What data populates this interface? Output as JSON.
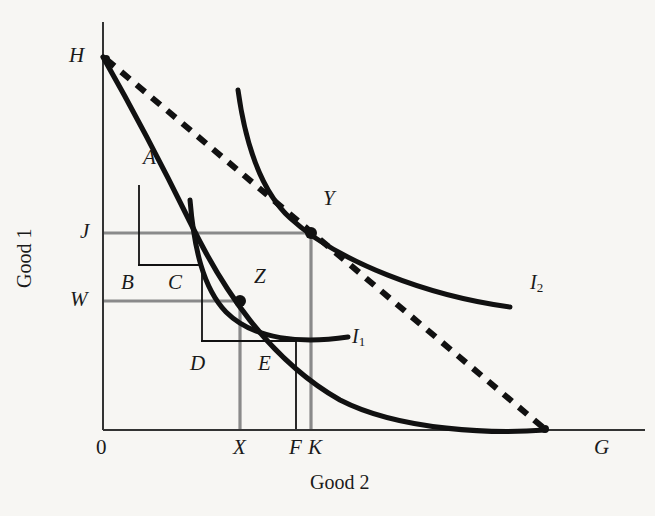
{
  "figure": {
    "type": "economics-diagram",
    "background_color": "#f7f6f3",
    "ink_color": "#111111",
    "guide_color": "#8a8a8a"
  },
  "axes": {
    "y_label": "Good 1",
    "x_label": "Good 2",
    "origin_label": "0",
    "x_axis": {
      "x_start": 103,
      "x_end": 645,
      "y": 430
    },
    "y_axis": {
      "x": 103,
      "y_start": 22,
      "y_end": 430
    }
  },
  "y_ticks": [
    {
      "label": "H",
      "value_px": 57,
      "type": "intercept"
    },
    {
      "label": "J",
      "value_px": 233,
      "type": "guide"
    },
    {
      "label": "W",
      "value_px": 301,
      "type": "guide"
    }
  ],
  "x_ticks": [
    {
      "label": "X",
      "value_px": 240,
      "type": "guide"
    },
    {
      "label": "F",
      "value_px": 296,
      "type": "thin"
    },
    {
      "label": "K",
      "value_px": 311,
      "type": "guide"
    },
    {
      "label": "G",
      "value_px": 600,
      "type": "intercept"
    }
  ],
  "points": [
    {
      "label": "Y",
      "x_px": 311,
      "y_px": 233,
      "marker": true,
      "label_dx": 16,
      "label_dy": -36
    },
    {
      "label": "Z",
      "x_px": 240,
      "y_px": 301,
      "marker": true,
      "label_dx": 18,
      "label_dy": -34
    },
    {
      "label": "A",
      "x_px": 148,
      "y_px": 158,
      "marker": false,
      "label_dx": 0,
      "label_dy": 0
    },
    {
      "label": "B",
      "x_px": 127,
      "y_px": 283,
      "marker": false,
      "label_dx": 0,
      "label_dy": 0
    },
    {
      "label": "C",
      "x_px": 173,
      "y_px": 283,
      "marker": false,
      "label_dx": 0,
      "label_dy": 0
    },
    {
      "label": "D",
      "x_px": 195,
      "y_px": 365,
      "marker": false,
      "label_dx": 0,
      "label_dy": 0
    },
    {
      "label": "E",
      "x_px": 263,
      "y_px": 365,
      "marker": false,
      "label_dx": 0,
      "label_dy": 0
    }
  ],
  "curves": [
    {
      "name": "ppf",
      "label": "",
      "style": "solid-thick",
      "path": "M 103,57 C 140,120 175,190 205,250 C 240,320 300,390 380,418 C 440,432 500,433 545,430"
    },
    {
      "name": "indifference-curve-1",
      "label": "I",
      "label_sub": "1",
      "style": "solid-thick",
      "label_x": 352,
      "label_y": 326,
      "path": "M 190,200 C 196,250 205,290 228,315 C 255,340 300,344 348,338"
    },
    {
      "name": "indifference-curve-2",
      "label": "I",
      "label_sub": "2",
      "style": "solid-thick",
      "label_x": 530,
      "label_y": 272,
      "path": "M 238,90 C 248,150 265,195 295,222 C 340,262 430,295 510,307"
    },
    {
      "name": "budget-line",
      "label": "",
      "style": "dashed-thick",
      "path": "M 105,58 L 545,429"
    }
  ],
  "guide_lines": [
    {
      "name": "j-horizontal",
      "color": "gray",
      "x1": 103,
      "y1": 233,
      "x2": 311,
      "y2": 233
    },
    {
      "name": "w-horizontal",
      "color": "gray",
      "x1": 103,
      "y1": 301,
      "x2": 240,
      "y2": 301
    },
    {
      "name": "x-vertical",
      "color": "gray",
      "x1": 240,
      "y1": 301,
      "x2": 240,
      "y2": 430
    },
    {
      "name": "k-vertical",
      "color": "gray",
      "x1": 311,
      "y1": 233,
      "x2": 311,
      "y2": 430
    },
    {
      "name": "a-vertical",
      "color": "black-thin",
      "x1": 139,
      "y1": 185,
      "x2": 139,
      "y2": 265
    },
    {
      "name": "bc-horizontal",
      "color": "black-thin",
      "x1": 139,
      "y1": 265,
      "x2": 202,
      "y2": 265
    },
    {
      "name": "c-vertical",
      "color": "black-thin",
      "x1": 202,
      "y1": 265,
      "x2": 202,
      "y2": 341
    },
    {
      "name": "de-horizontal",
      "color": "black-thin",
      "x1": 202,
      "y1": 341,
      "x2": 296,
      "y2": 341
    },
    {
      "name": "f-vertical",
      "color": "black-thin",
      "x1": 296,
      "y1": 341,
      "x2": 296,
      "y2": 430
    }
  ]
}
